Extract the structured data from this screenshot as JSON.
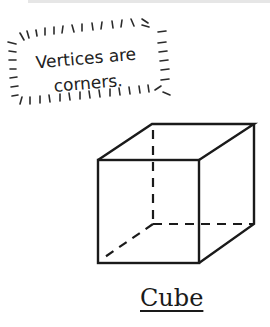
{
  "note": {
    "line1": "Vertices are",
    "line2": "corners."
  },
  "figure": {
    "shape": "cube",
    "label": "Cube",
    "hidden_edges_style": "dashed"
  },
  "colors": {
    "ink": "#1a1a1a",
    "topbar": "#e6e6e6",
    "background": "#ffffff"
  }
}
